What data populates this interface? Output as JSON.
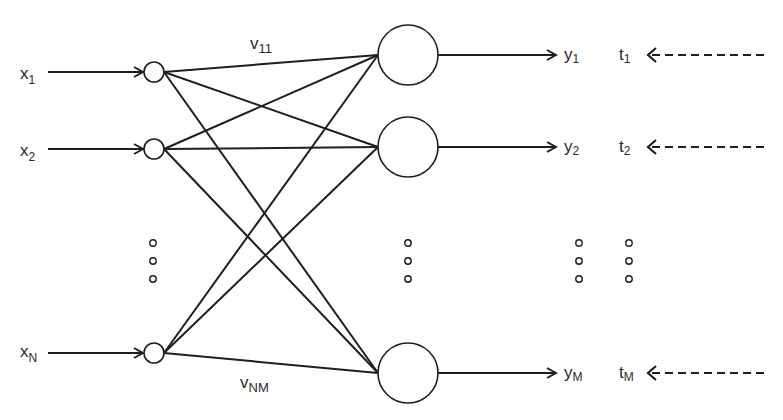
{
  "diagram": {
    "inputs": [
      {
        "label": "x",
        "sub": "1",
        "y": 72
      },
      {
        "label": "x",
        "sub": "2",
        "y": 149
      },
      {
        "label": "x",
        "sub": "N",
        "y": 353
      }
    ],
    "outputs": [
      {
        "label": "y",
        "sub": "1",
        "y": 55
      },
      {
        "label": "y",
        "sub": "2",
        "y": 147
      },
      {
        "label": "y",
        "sub": "M",
        "y": 373
      }
    ],
    "targets": [
      {
        "label": "t",
        "sub": "1",
        "y": 55
      },
      {
        "label": "t",
        "sub": "2",
        "y": 147
      },
      {
        "label": "t",
        "sub": "M",
        "y": 373
      }
    ],
    "weights": {
      "first": {
        "label": "v",
        "sub": "11"
      },
      "last": {
        "label": "v",
        "sub": "NM"
      }
    },
    "ellipsis": "⋮",
    "colors": {
      "stroke": "#1e1e1e",
      "text": "#2a2a2a",
      "background": "#ffffff"
    }
  }
}
